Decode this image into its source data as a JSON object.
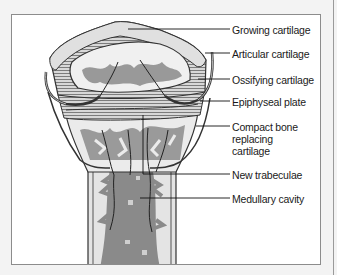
{
  "diagram": {
    "labels": [
      {
        "id": "growing-cartilage",
        "text": "Growing cartilage"
      },
      {
        "id": "articular-cartilage",
        "text": "Articular cartilage"
      },
      {
        "id": "ossifying-cartilage",
        "text": "Ossifying cartilage"
      },
      {
        "id": "epiphyseal-plate",
        "text": "Epiphyseal plate"
      },
      {
        "id": "compact-bone",
        "lines": [
          "Compact bone",
          "replacing",
          "cartilage"
        ]
      },
      {
        "id": "new-trabeculae",
        "text": "New trabeculae"
      },
      {
        "id": "medullary-cavity",
        "text": "Medullary cavity"
      }
    ]
  }
}
